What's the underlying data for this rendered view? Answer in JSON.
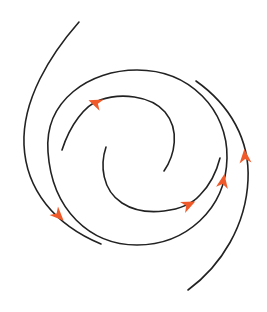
{
  "diagram": {
    "title": "",
    "colors": {
      "background": "#ffffff",
      "curve": "#222222",
      "arrow": "#f05a2a"
    },
    "curves": [
      {
        "id": "outer-left-arc",
        "path": "M79,22 C50,55 22,100 24,145 C26,190 55,225 101,244"
      },
      {
        "id": "big-loop",
        "path": "M48,152 C44,100 90,70 137,70 C190,70 228,110 227,158 C226,210 185,245 137,245 C90,245 52,210 48,152"
      },
      {
        "id": "inner-top-arc",
        "path": "M62,150 C70,125 85,105 100,100 C120,93 150,95 165,112 C180,130 175,155 164,171"
      },
      {
        "id": "inner-bottom-arc",
        "path": "M106,147 C100,165 102,190 122,203 C145,218 185,212 200,195 C210,185 217,170 220,158"
      },
      {
        "id": "outer-right-arc",
        "path": "M196,81 C230,105 250,140 248,180 C246,225 222,265 188,290"
      }
    ],
    "arrows": [
      {
        "id": "arrow-outer-left",
        "x": 58,
        "y": 215,
        "angle": 45
      },
      {
        "id": "arrow-inner-top",
        "x": 96,
        "y": 103,
        "angle": 200
      },
      {
        "id": "arrow-inner-bottom",
        "x": 188,
        "y": 205,
        "angle": -25
      },
      {
        "id": "arrow-big-loop",
        "x": 223,
        "y": 182,
        "angle": -80
      },
      {
        "id": "arrow-outer-right",
        "x": 245,
        "y": 157,
        "angle": -95
      }
    ]
  }
}
